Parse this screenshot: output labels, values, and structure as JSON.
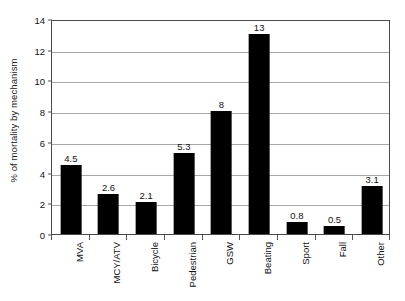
{
  "chart_data": {
    "type": "bar",
    "title": "",
    "xlabel": "",
    "ylabel": "% of mortality by mechanism",
    "categories": [
      "MVA",
      "MCY/ATV",
      "Bicycle",
      "Pedestrian",
      "GSW",
      "Beating",
      "Sport",
      "Fall",
      "Other"
    ],
    "values": [
      4.5,
      2.6,
      2.1,
      5.3,
      8,
      13,
      0.8,
      0.5,
      3.1
    ],
    "value_labels": [
      "4.5",
      "2.6",
      "2.1",
      "5.3",
      "8",
      "13",
      "0.8",
      "0.5",
      "3.1"
    ],
    "ylim": [
      0,
      14
    ],
    "y_ticks": [
      0,
      2,
      4,
      6,
      8,
      10,
      12,
      14
    ],
    "y_tick_labels": [
      "0",
      "2",
      "4",
      "6",
      "8",
      "10",
      "12",
      "14"
    ],
    "grid": true,
    "legend": false,
    "bar_color": "#000000",
    "gridline_color": "#a8a8a8",
    "axis_color": "#4a4a4a"
  }
}
